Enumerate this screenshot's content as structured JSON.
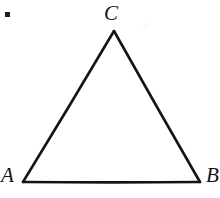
{
  "figure": {
    "background_color": "#ffffff",
    "stroke_color": "#141414",
    "width": 220,
    "height": 198
  },
  "marker": {
    "name": "corner-square-marker",
    "color": "#1c1c1c",
    "x": 5,
    "y": 12,
    "size": 5
  },
  "chart_data": {
    "type": "diagram",
    "shape": "triangle",
    "stroke_color": "#141414",
    "stroke_width": 2.6,
    "fill": "none",
    "vertices": [
      {
        "label": "A",
        "x": 23,
        "y": 182
      },
      {
        "label": "B",
        "x": 200,
        "y": 182
      },
      {
        "label": "C",
        "x": 114,
        "y": 31
      }
    ],
    "edges": [
      {
        "from": "A",
        "to": "C"
      },
      {
        "from": "C",
        "to": "B"
      },
      {
        "from": "B",
        "to": "A"
      }
    ],
    "labels": [
      {
        "text": "C",
        "x": 104,
        "y": 3,
        "anchor": "apex-top"
      },
      {
        "text": "A",
        "x": 1,
        "y": 165,
        "anchor": "bottom-left"
      },
      {
        "text": "B",
        "x": 206,
        "y": 165,
        "anchor": "bottom-right",
        "clipped": true
      }
    ]
  },
  "labels": {
    "vertex_a": "A",
    "vertex_b": "B",
    "vertex_c": "C"
  }
}
